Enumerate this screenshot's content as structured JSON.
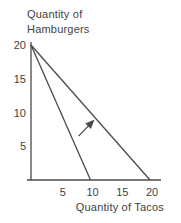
{
  "chart_data": {
    "type": "line",
    "title": "",
    "xlabel": "Quantity of Tacos",
    "ylabel": "Quantity of Hamburgers",
    "ylabel_display": "Quantity of\nHamburgers",
    "x_ticks": [
      5,
      10,
      15,
      20
    ],
    "y_ticks": [
      20,
      15,
      10,
      5
    ],
    "xlim": [
      0,
      21
    ],
    "ylim": [
      0,
      21
    ],
    "grid": false,
    "legend_position": "none",
    "series": [
      {
        "name": "inner-frontier",
        "points": [
          [
            0,
            20
          ],
          [
            10,
            0
          ]
        ]
      },
      {
        "name": "outer-frontier",
        "points": [
          [
            0,
            20
          ],
          [
            20,
            0
          ]
        ]
      }
    ],
    "annotations": [
      {
        "type": "arrow",
        "from": [
          8,
          6.5
        ],
        "to": [
          10.5,
          8.8
        ],
        "meaning": "outward shift of frontier"
      }
    ],
    "colors": {
      "line": "#4a4a4a",
      "text": "#3f3f3f",
      "background": "#ffffff"
    }
  }
}
